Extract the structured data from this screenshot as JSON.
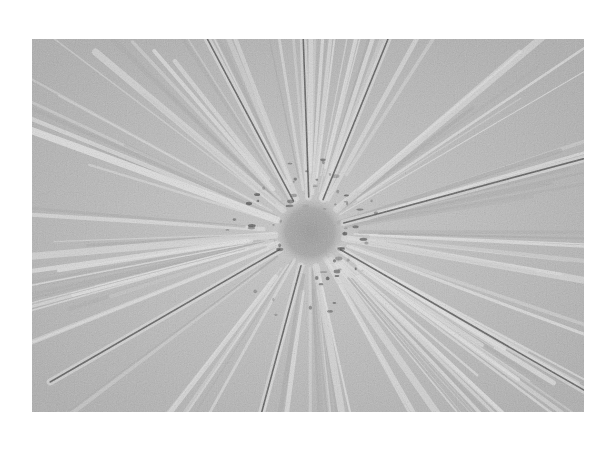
{
  "image": {
    "kind": "grayscale micrograph",
    "subject": "radial starburst pattern of elongated streaks converging on a central dark region",
    "colors": {
      "page_background": "#ffffff",
      "field_gray": "#b9b9b9",
      "light_streak": "#e4e4e4",
      "dark_crease": "#3a3a3a",
      "center_blob": "#9e9e9e"
    },
    "center": {
      "x": 310,
      "y": 232
    },
    "bounds": {
      "left": 32,
      "top": 39,
      "width": 552,
      "height": 373
    }
  },
  "rays": [
    {
      "angle": -92,
      "len": 230,
      "dark": true
    },
    {
      "angle": -118,
      "len": 240,
      "dark": true
    },
    {
      "angle": -140,
      "len": 280,
      "dark": false
    },
    {
      "angle": -160,
      "len": 300,
      "dark": false
    },
    {
      "angle": -68,
      "len": 260,
      "dark": true
    },
    {
      "angle": -40,
      "len": 320,
      "dark": false
    },
    {
      "angle": -15,
      "len": 330,
      "dark": true
    },
    {
      "angle": 10,
      "len": 330,
      "dark": false
    },
    {
      "angle": 30,
      "len": 320,
      "dark": true
    },
    {
      "angle": 55,
      "len": 300,
      "dark": false
    },
    {
      "angle": 80,
      "len": 230,
      "dark": false
    },
    {
      "angle": 105,
      "len": 240,
      "dark": true
    },
    {
      "angle": 150,
      "len": 300,
      "dark": true
    },
    {
      "angle": 175,
      "len": 300,
      "dark": false
    },
    {
      "angle": 200,
      "len": 300,
      "dark": false
    }
  ]
}
